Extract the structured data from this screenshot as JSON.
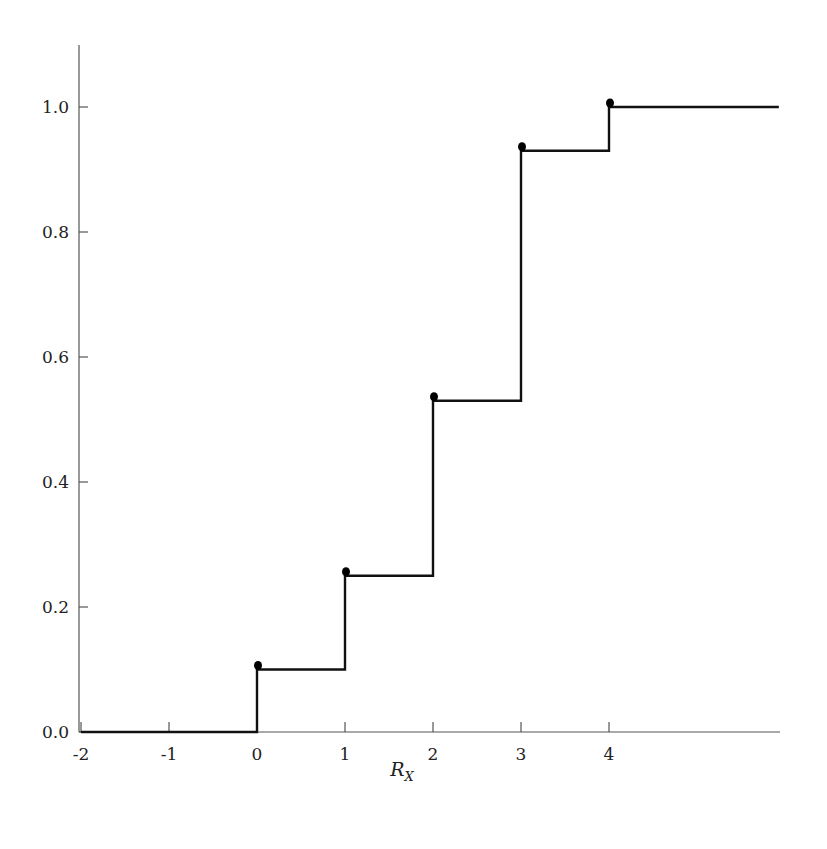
{
  "chart_data": {
    "type": "line",
    "subtype": "step-cdf",
    "title": "",
    "xlabel": "R_X",
    "xlabel_main": "R",
    "xlabel_sub": "X",
    "ylabel": "",
    "xlim": [
      -2,
      5.95
    ],
    "ylim": [
      0,
      1.1
    ],
    "x_ticks": [
      -2,
      -1,
      0,
      1,
      2,
      3,
      4
    ],
    "x_tick_labels": [
      "-2",
      "-1",
      "0",
      "1",
      "2",
      "3",
      "4"
    ],
    "y_ticks": [
      0.0,
      0.2,
      0.4,
      0.6,
      0.8,
      1.0
    ],
    "y_tick_labels": [
      "0.0",
      "0.2",
      "0.4",
      "0.6",
      "0.8",
      "1.0"
    ],
    "grid": false,
    "legend": null,
    "steps": [
      {
        "x_start": -2,
        "x_end": 0,
        "y": 0.0
      },
      {
        "x_start": 0,
        "x_end": 1,
        "y": 0.1
      },
      {
        "x_start": 1,
        "x_end": 2,
        "y": 0.25
      },
      {
        "x_start": 2,
        "x_end": 3,
        "y": 0.53
      },
      {
        "x_start": 3,
        "x_end": 4,
        "y": 0.93
      },
      {
        "x_start": 4,
        "x_end": 5.93,
        "y": 1.0
      }
    ],
    "jump_points": [
      {
        "x": 0,
        "y": 0.1
      },
      {
        "x": 1,
        "y": 0.25
      },
      {
        "x": 2,
        "y": 0.53
      },
      {
        "x": 3,
        "y": 0.93
      },
      {
        "x": 4,
        "y": 1.0
      }
    ],
    "colors": {
      "line": "#111111",
      "axis": "#555555",
      "dot": "#000000"
    }
  }
}
